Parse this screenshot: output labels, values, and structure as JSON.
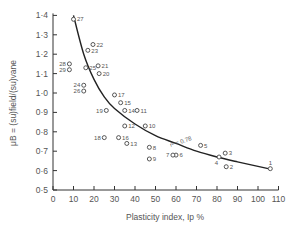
{
  "chart_data": {
    "type": "scatter",
    "title": "",
    "xlabel": "Plasticity index, Ip %",
    "ylabel": "μB = (su)field/(su)vane",
    "xlim": [
      0,
      110
    ],
    "ylim": [
      0.5,
      1.4
    ],
    "xticks": [
      0,
      10,
      20,
      30,
      40,
      50,
      60,
      70,
      80,
      90,
      100,
      110
    ],
    "yticks": [
      "0·5",
      "0·6",
      "0·7",
      "0·8",
      "0·9",
      "1·0",
      "1·1",
      "1·2",
      "1·3",
      "1·4"
    ],
    "grid": false,
    "legend": null,
    "annotations": [
      {
        "text": "r² = 0.78",
        "x": 62,
        "y": 0.77
      }
    ],
    "points": [
      {
        "label": "1",
        "x": 106,
        "y": 0.61
      },
      {
        "label": "2",
        "x": 84.5,
        "y": 0.62
      },
      {
        "label": "3",
        "x": 84,
        "y": 0.69
      },
      {
        "label": "4",
        "x": 81,
        "y": 0.67
      },
      {
        "label": "5",
        "x": 72,
        "y": 0.73
      },
      {
        "label": "6",
        "x": 60,
        "y": 0.68
      },
      {
        "label": "7",
        "x": 58.5,
        "y": 0.68
      },
      {
        "label": "8",
        "x": 47,
        "y": 0.72
      },
      {
        "label": "9",
        "x": 47,
        "y": 0.66
      },
      {
        "label": "10",
        "x": 45,
        "y": 0.83
      },
      {
        "label": "11",
        "x": 41,
        "y": 0.91
      },
      {
        "label": "12",
        "x": 35,
        "y": 0.83
      },
      {
        "label": "13",
        "x": 36,
        "y": 0.74
      },
      {
        "label": "14",
        "x": 35,
        "y": 0.91
      },
      {
        "label": "15",
        "x": 33,
        "y": 0.95
      },
      {
        "label": "16",
        "x": 32,
        "y": 0.77
      },
      {
        "label": "17",
        "x": 30,
        "y": 0.99
      },
      {
        "label": "18",
        "x": 25,
        "y": 0.77
      },
      {
        "label": "19",
        "x": 26,
        "y": 0.91
      },
      {
        "label": "20",
        "x": 22.5,
        "y": 1.1
      },
      {
        "label": "21",
        "x": 22,
        "y": 1.14
      },
      {
        "label": "22",
        "x": 19.5,
        "y": 1.25
      },
      {
        "label": "23",
        "x": 17,
        "y": 1.22
      },
      {
        "label": "24",
        "x": 15,
        "y": 1.04
      },
      {
        "label": "25",
        "x": 16,
        "y": 1.13
      },
      {
        "label": "26",
        "x": 15,
        "y": 1.01
      },
      {
        "label": "27",
        "x": 10,
        "y": 1.38
      },
      {
        "label": "28",
        "x": 8,
        "y": 1.15
      },
      {
        "label": "29",
        "x": 8,
        "y": 1.12
      }
    ],
    "fit_curve": {
      "description": "Best-fit curve decreasing with plasticity index",
      "x": [
        10,
        15,
        20,
        25,
        30,
        40,
        50,
        60,
        70,
        80,
        90,
        105
      ],
      "y": [
        1.4,
        1.2,
        1.07,
        0.98,
        0.92,
        0.84,
        0.78,
        0.74,
        0.7,
        0.67,
        0.645,
        0.61
      ]
    }
  }
}
